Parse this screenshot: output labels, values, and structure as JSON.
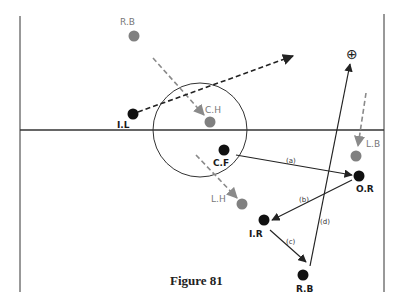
{
  "figure": {
    "caption": "Figure 81"
  },
  "field": {
    "left_x": 20,
    "right_x": 384,
    "top_y": 16,
    "bottom_y": 292,
    "center_line_y": 130,
    "center_circle": {
      "cx": 200,
      "cy": 130,
      "r": 47
    }
  },
  "players": {
    "attackers": [
      {
        "id": "IL",
        "label": "I.L",
        "x": 133,
        "y": 114
      },
      {
        "id": "CF",
        "label": "C.F",
        "x": 224,
        "y": 150
      },
      {
        "id": "OR",
        "label": "O.R",
        "x": 359,
        "y": 176
      },
      {
        "id": "IR",
        "label": "I.R",
        "x": 264,
        "y": 220
      },
      {
        "id": "RB",
        "label": "R.B",
        "x": 303,
        "y": 275
      }
    ],
    "defenders": [
      {
        "id": "RB_def",
        "label": "R.B",
        "x": 134,
        "y": 36
      },
      {
        "id": "CH",
        "label": "C.H",
        "x": 210,
        "y": 122
      },
      {
        "id": "LB",
        "label": "L.B",
        "x": 356,
        "y": 156
      },
      {
        "id": "LH",
        "label": "L.H",
        "x": 242,
        "y": 204
      }
    ]
  },
  "passes": [
    {
      "label": "(a)",
      "from": "CF",
      "to": "OR"
    },
    {
      "label": "(b)",
      "from": "OR",
      "to": "IR"
    },
    {
      "label": "(c)",
      "from": "IR",
      "to": "RB"
    },
    {
      "label": "(d)",
      "from": "RB",
      "to": "target"
    }
  ],
  "target_marker": {
    "symbol": "⊕",
    "x": 352,
    "y": 54
  },
  "colors": {
    "attacker": "#111111",
    "defender": "#808080",
    "line": "#222222",
    "dashed_grey": "#8a8a8a"
  }
}
